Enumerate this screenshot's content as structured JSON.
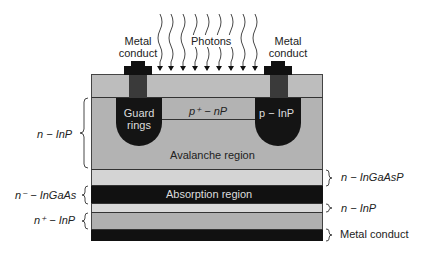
{
  "diagram": {
    "labels": {
      "metal_conduct_left": "Metal\nconduct",
      "metal_conduct_left_l1": "Metal",
      "metal_conduct_left_l2": "conduct",
      "photons": "Photons",
      "metal_conduct_right_l1": "Metal",
      "metal_conduct_right_l2": "conduct",
      "guard_rings_l1": "Guard",
      "guard_rings_l2": "rings",
      "p_plus_nP": "p⁺ − nP",
      "p_InP": "p − InP",
      "avalanche_region": "Avalanche region",
      "absorption_region": "Absorption region",
      "n_InP_left": "n − InP",
      "n_InGaAsP": "n − InGaAsP",
      "n_minus_InGaAs": "n⁻ − InGaAs",
      "n_InP_right": "n − InP",
      "n_plus_InP": "n⁺ − InP",
      "metal_conduct_bottom": "Metal conduct"
    },
    "colors": {
      "top_layer": "#bdbdbd",
      "avalanche": "#b3b3b3",
      "ingaasp": "#d4d4d4",
      "absorption": "#111111",
      "thin_inp": "#d9d9d9",
      "n_plus_inp": "#b0b0b0",
      "metal": "#111111",
      "guard": "#141414",
      "contact_stem": "#3a3a3a"
    },
    "photon_count": 9
  }
}
